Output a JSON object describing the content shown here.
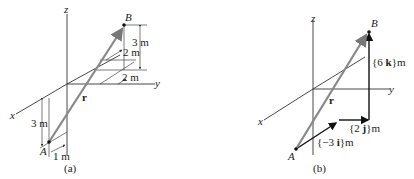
{
  "figure_a": {
    "caption": "(a)",
    "axes": {
      "x": "x",
      "y": "y",
      "z": "z"
    },
    "points": {
      "A": "A",
      "B": "B"
    },
    "vector_label": "r",
    "dimensions": {
      "A_height": "3 m",
      "A_offset": "1 m",
      "B_height": "3 m",
      "B_depth": "2 m",
      "B_side": "2 m"
    }
  },
  "figure_b": {
    "caption": "(b)",
    "axes": {
      "x": "x",
      "y": "y",
      "z": "z"
    },
    "points": {
      "A": "A",
      "B": "B"
    },
    "vector_label": "r",
    "components": {
      "i": {
        "open": "{−3 ",
        "unit": "i",
        "close": "}m"
      },
      "j": {
        "open": "{2 ",
        "unit": "j",
        "close": "}m"
      },
      "k": {
        "open": "{6 ",
        "unit": "k",
        "close": "}m"
      }
    }
  },
  "colors": {
    "position_vector": "#888888",
    "components": "#111111",
    "axes": "#333333"
  }
}
